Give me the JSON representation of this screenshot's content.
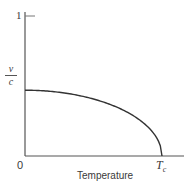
{
  "chart_data": {
    "type": "line",
    "title": "",
    "xlabel": "Temperature",
    "ylabel": "v/c",
    "ylabel_numerator": "v",
    "ylabel_denominator": "c",
    "x_ticks": [
      {
        "value": 0,
        "label": "0"
      },
      {
        "value": 1,
        "label": "Tc"
      }
    ],
    "y_ticks": [
      {
        "value": 1,
        "label": "1"
      }
    ],
    "xlim": [
      0,
      1.14
    ],
    "ylim": [
      0,
      1.0
    ],
    "grid": false,
    "legend": null,
    "series": [
      {
        "name": "v/c vs T",
        "x": [
          0,
          0.1,
          0.2,
          0.3,
          0.4,
          0.5,
          0.6,
          0.7,
          0.8,
          0.9,
          0.95,
          0.98,
          1.0
        ],
        "y": [
          0.47,
          0.468,
          0.46,
          0.448,
          0.431,
          0.407,
          0.376,
          0.336,
          0.282,
          0.205,
          0.147,
          0.094,
          0.0
        ]
      }
    ],
    "annotations": []
  },
  "labels": {
    "origin": "0",
    "y_tick_one": "1",
    "tc_main": "T",
    "tc_sub": "c",
    "x_axis_title": "Temperature",
    "y_num": "v",
    "y_den": "c"
  },
  "colors": {
    "axis": "#555555",
    "curve": "#333333",
    "text": "#3a3a3a"
  }
}
